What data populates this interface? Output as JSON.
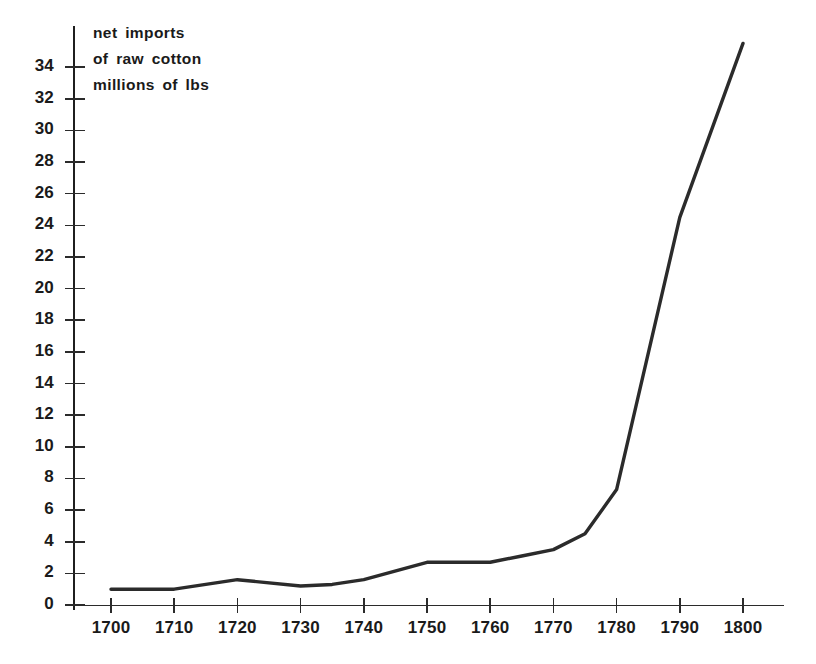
{
  "chart_data": {
    "type": "line",
    "title": "net imports of raw cotton millions of lbs",
    "title_lines": [
      "net imports",
      "of raw cotton",
      "millions of lbs"
    ],
    "xlabel": "",
    "ylabel": "",
    "xlim": [
      1695,
      1805
    ],
    "ylim": [
      0,
      35.5
    ],
    "grid": false,
    "legend": null,
    "x_ticks": [
      1700,
      1710,
      1720,
      1730,
      1740,
      1750,
      1760,
      1770,
      1780,
      1790,
      1800
    ],
    "x_tick_labels": [
      "1700",
      "1710",
      "1720",
      "1730",
      "1740",
      "1750",
      "1760",
      "1770",
      "1780",
      "1790",
      "1800"
    ],
    "y_ticks": [
      0,
      2,
      4,
      6,
      8,
      10,
      12,
      14,
      16,
      18,
      20,
      22,
      24,
      26,
      28,
      30,
      32,
      34
    ],
    "y_tick_labels": [
      "0",
      "2",
      "4",
      "6",
      "8",
      "10",
      "12",
      "14",
      "16",
      "18",
      "20",
      "22",
      "24",
      "26",
      "28",
      "30",
      "32",
      "34"
    ],
    "series": [
      {
        "name": "net imports of raw cotton",
        "x": [
          1700,
          1710,
          1720,
          1730,
          1735,
          1740,
          1750,
          1760,
          1765,
          1770,
          1775,
          1780,
          1790,
          1800
        ],
        "values": [
          1.0,
          1.0,
          1.6,
          1.2,
          1.3,
          1.6,
          2.7,
          2.7,
          3.1,
          3.5,
          4.5,
          7.3,
          24.5,
          35.5
        ],
        "color": "#2b2b2b"
      }
    ],
    "axis_color": "#2b2b2b",
    "background": "#ffffff"
  }
}
